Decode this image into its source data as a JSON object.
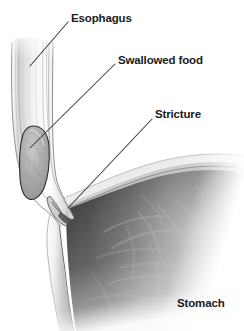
{
  "figure": {
    "background_color": "#ffffff",
    "width": 244,
    "height": 331
  },
  "labels": {
    "esophagus": "Esophagus",
    "swallowed_food": "Swallowed food",
    "stricture": "Stricture",
    "stomach": "Stomach"
  },
  "colors": {
    "label_text": "#1b1b1b",
    "leader_line": "#3a3a3a",
    "esophagus_wall_light": "#f2f2f2",
    "esophagus_wall_mid": "#c9c9c9",
    "esophagus_outline": "#4a4a4a",
    "food_bolus_fill": "#a9a9a9",
    "food_bolus_outline": "#2e2e2e",
    "stomach_cavity_dark": "#5d5d5d",
    "stomach_cavity_mid": "#8a8a8a",
    "stomach_wall_light": "#ededed",
    "stomach_rugae": "#b5b5b5"
  },
  "leader_lines": {
    "esophagus": {
      "x1": 30,
      "y1": 66,
      "x2": 68,
      "y2": 22
    },
    "swallowed_food": {
      "x1": 30,
      "y1": 148,
      "x2": 115,
      "y2": 64
    },
    "stricture": {
      "x1": 68,
      "y1": 208,
      "x2": 152,
      "y2": 119
    }
  },
  "structures": [
    {
      "name": "esophagus",
      "description": "Vertical muscular tube entering from top of frame, fading out at the top edge"
    },
    {
      "name": "swallowed-food-bolus",
      "description": "Oval gray food mass lodged above the narrowing"
    },
    {
      "name": "stricture",
      "description": "Narrowed segment at the gastroesophageal junction"
    },
    {
      "name": "stomach",
      "description": "Large dark gastric cavity with fundus wall and rugae, occupying lower right"
    }
  ]
}
